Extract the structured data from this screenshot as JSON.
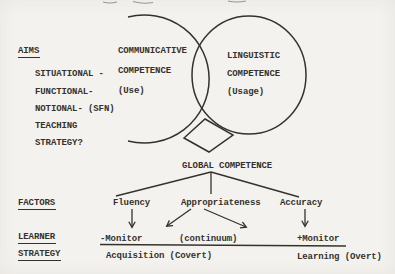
{
  "colors": {
    "paper": "#f4f2ee",
    "ink": "#35322c",
    "faint": "#9a968e"
  },
  "figure": {
    "aims": {
      "heading": "AIMS",
      "items": [
        "SITUATIONAL -",
        "FUNCTIONAL-",
        "NOTIONAL- (SFN)",
        "TEACHING",
        "STRATEGY?"
      ]
    },
    "venn": {
      "communicative": {
        "line1": "COMMUNICATIVE",
        "line2": "COMPETENCE",
        "line3": "(Use)"
      },
      "linguistic": {
        "line1": "LINGUISTIC",
        "line2": "COMPETENCE",
        "line3": "(Usage)"
      },
      "global": "GLOBAL COMPETENCE"
    },
    "factors": {
      "heading": "FACTORS",
      "items": [
        "Fluency",
        "Appropriateness",
        "Accuracy"
      ]
    },
    "learner_strategy": {
      "heading_line1": "LEARNER",
      "heading_line2": "STRATEGY",
      "monitor_left": "-Monitor",
      "continuum": "(continuum)",
      "monitor_right": "+Monitor",
      "acquisition": "Acquisition (Covert)",
      "learning": "Learning (Overt)"
    }
  }
}
